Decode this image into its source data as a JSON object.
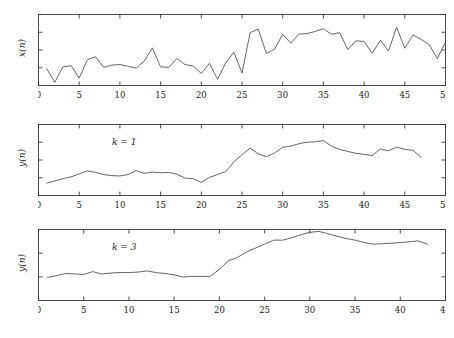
{
  "figure": {
    "background_color": "#ffffff",
    "line_color": "#4a4a4a",
    "axis_color": "#3a3a3a",
    "text_color": "#1a1a1a",
    "width": 454,
    "height": 338
  },
  "chart_data": [
    {
      "type": "line",
      "panel": "top",
      "title": "",
      "xlabel": "",
      "ylabel": "x(n)",
      "annotation": "",
      "xlim": [
        0,
        50
      ],
      "ylim": [
        0,
        4
      ],
      "xticks": [
        0,
        5,
        10,
        15,
        20,
        25,
        30,
        35,
        40,
        45,
        50
      ],
      "yticks": [
        0,
        1,
        2,
        3,
        4
      ],
      "grid": false,
      "legend": "none",
      "x": [
        1,
        2,
        3,
        4,
        5,
        6,
        7,
        8,
        9,
        10,
        11,
        12,
        13,
        14,
        15,
        16,
        17,
        18,
        19,
        20,
        21,
        22,
        23,
        24,
        25,
        26,
        27,
        28,
        29,
        30,
        31,
        32,
        33,
        34,
        35,
        36,
        37,
        38,
        39,
        40,
        41,
        42,
        43,
        44,
        45,
        46,
        47,
        48,
        49,
        50
      ],
      "values": [
        0.95,
        0.18,
        1.05,
        1.12,
        0.42,
        1.45,
        1.62,
        1.02,
        1.15,
        1.18,
        1.08,
        0.98,
        1.38,
        2.12,
        1.05,
        1.02,
        1.52,
        1.18,
        1.1,
        0.68,
        1.25,
        0.35,
        1.28,
        1.88,
        0.7,
        2.98,
        3.18,
        1.8,
        2.05,
        2.88,
        2.38,
        2.9,
        2.92,
        3.05,
        3.2,
        2.88,
        2.98,
        2.02,
        2.52,
        2.48,
        1.82,
        2.55,
        1.95,
        3.28,
        2.1,
        2.85,
        2.6,
        2.3,
        1.52,
        2.45
      ]
    },
    {
      "type": "line",
      "panel": "middle",
      "title": "",
      "xlabel": "",
      "ylabel": "y(n)",
      "annotation": "k = 1",
      "xlim": [
        0,
        50
      ],
      "ylim": [
        0,
        4
      ],
      "xticks": [
        0,
        5,
        10,
        15,
        20,
        25,
        30,
        35,
        40,
        45,
        50
      ],
      "yticks": [
        0,
        1,
        2,
        3,
        4
      ],
      "grid": false,
      "legend": "none",
      "x": [
        1,
        2,
        3,
        4,
        5,
        6,
        7,
        8,
        9,
        10,
        11,
        12,
        13,
        14,
        15,
        16,
        17,
        18,
        19,
        20,
        21,
        22,
        23,
        24,
        25,
        26,
        27,
        28,
        29,
        30,
        31,
        32,
        33,
        34,
        35,
        36,
        37,
        38,
        39,
        40,
        41,
        42,
        43,
        44,
        45,
        46,
        47
      ],
      "values": [
        0.7,
        0.82,
        0.95,
        1.05,
        1.22,
        1.38,
        1.3,
        1.18,
        1.12,
        1.1,
        1.18,
        1.4,
        1.25,
        1.32,
        1.28,
        1.3,
        1.2,
        0.98,
        0.95,
        0.74,
        1.02,
        1.18,
        1.35,
        1.9,
        2.3,
        2.66,
        2.35,
        2.18,
        2.4,
        2.72,
        2.78,
        2.92,
        3.0,
        3.02,
        3.1,
        2.78,
        2.6,
        2.48,
        2.38,
        2.32,
        2.25,
        2.62,
        2.52,
        2.72,
        2.6,
        2.55,
        2.15
      ]
    },
    {
      "type": "line",
      "panel": "bottom",
      "title": "",
      "xlabel": "",
      "ylabel": "y(n)",
      "annotation": "k = 3",
      "xlim": [
        0,
        45
      ],
      "ylim": [
        0,
        3
      ],
      "xticks": [
        0,
        5,
        10,
        15,
        20,
        25,
        30,
        35,
        40,
        45
      ],
      "yticks": [
        0,
        1,
        2,
        3
      ],
      "grid": false,
      "legend": "none",
      "x": [
        1,
        2,
        3,
        4,
        5,
        6,
        7,
        8,
        9,
        10,
        11,
        12,
        13,
        14,
        15,
        16,
        17,
        18,
        19,
        20,
        21,
        22,
        23,
        24,
        25,
        26,
        27,
        28,
        29,
        30,
        31,
        32,
        33,
        34,
        35,
        36,
        37,
        38,
        39,
        40,
        41,
        42,
        43
      ],
      "values": [
        0.98,
        1.05,
        1.14,
        1.12,
        1.1,
        1.22,
        1.12,
        1.16,
        1.18,
        1.18,
        1.2,
        1.25,
        1.18,
        1.14,
        1.08,
        0.99,
        1.02,
        1.02,
        1.02,
        1.32,
        1.68,
        1.82,
        2.05,
        2.22,
        2.38,
        2.55,
        2.55,
        2.65,
        2.78,
        2.88,
        2.92,
        2.82,
        2.72,
        2.62,
        2.55,
        2.45,
        2.38,
        2.4,
        2.42,
        2.45,
        2.48,
        2.52,
        2.38
      ]
    }
  ]
}
